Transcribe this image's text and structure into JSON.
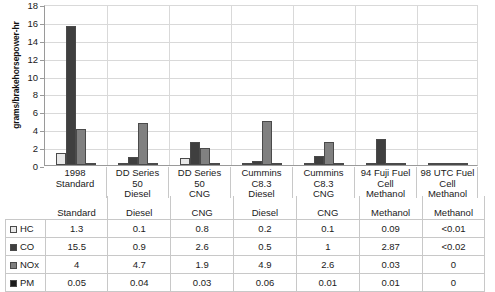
{
  "chart_data": {
    "type": "bar",
    "title": "",
    "xlabel": "",
    "ylabel": "grams/brakehorsepower-hr",
    "ylim": [
      0,
      18
    ],
    "ytick_step": 2,
    "yticks": [
      "18",
      "16",
      "14",
      "12",
      "10",
      "8",
      "6",
      "4",
      "2",
      "0"
    ],
    "grid": true,
    "legend_position": "table-left-column",
    "categories": [
      "1998 Standard",
      "DD Series 50 Diesel",
      "DD Series 50 CNG",
      "Cummins C8.3 Diesel",
      "Cummins C8.3 CNG",
      "94 Fuji Fuel Cell Methanol",
      "98 UTC Fuel Cell Methanol"
    ],
    "category_lines": [
      [
        "1998",
        "Standard"
      ],
      [
        "DD Series",
        "50",
        "Diesel"
      ],
      [
        "DD Series",
        "50",
        "CNG"
      ],
      [
        "Cummins",
        "C8.3",
        "Diesel"
      ],
      [
        "Cummins",
        "C8.3",
        "CNG"
      ],
      [
        "94 Fuji Fuel",
        "Cell",
        "Methanol"
      ],
      [
        "98 UTC Fuel",
        "Cell",
        "Methanol"
      ]
    ],
    "series": [
      {
        "name": "HC",
        "color": "#e8e8e8",
        "values": [
          1.3,
          0.1,
          0.8,
          0.2,
          0.1,
          0.09,
          0.01
        ],
        "labels": [
          "1.3",
          "0.1",
          "0.8",
          "0.2",
          "0.1",
          "0.09",
          "<0.01"
        ]
      },
      {
        "name": "CO",
        "color": "#3f3f3f",
        "values": [
          15.5,
          0.9,
          2.6,
          0.5,
          1,
          2.87,
          0.02
        ],
        "labels": [
          "15.5",
          "0.9",
          "2.6",
          "0.5",
          "1",
          "2.87",
          "<0.02"
        ]
      },
      {
        "name": "NOx",
        "color": "#808080",
        "values": [
          4,
          4.7,
          1.9,
          4.9,
          2.6,
          0.03,
          0
        ],
        "labels": [
          "4",
          "4.7",
          "1.9",
          "4.9",
          "2.6",
          "0.03",
          "0"
        ]
      },
      {
        "name": "PM",
        "color": "#1c1c1c",
        "values": [
          0.05,
          0.04,
          0.03,
          0.06,
          0.01,
          0.01,
          0
        ],
        "labels": [
          "0.05",
          "0.04",
          "0.03",
          "0.06",
          "0.01",
          "0.01",
          "0"
        ]
      }
    ]
  },
  "table": {
    "row_header_labels": [
      "HC",
      "CO",
      "NOx",
      "PM"
    ]
  },
  "colors": {
    "axis": "#9a9a9a",
    "grid": "#d9d9d9",
    "border": "#c8c8c8",
    "text": "#1a1a1a",
    "bar_outline": "#4a4a4a"
  }
}
